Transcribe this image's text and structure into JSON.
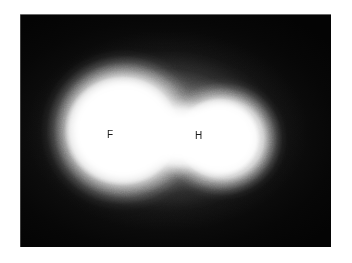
{
  "figure": {
    "kind": "grayscale-luminescence-image",
    "width": 352,
    "height": 263,
    "page_background": "#ffffff",
    "panel_background": "#050505",
    "emission_color": "#ffffff",
    "label_color": "#1a1a1a"
  },
  "panel": {
    "name": "dark-field-image",
    "left": 20,
    "top": 14,
    "width": 311,
    "height": 233
  },
  "regions": [
    {
      "id": "region-f",
      "label": "F",
      "role": "large-left-lobe",
      "center_x": 112,
      "center_y": 135,
      "radius_x": 86,
      "radius_y": 84,
      "peak_intensity": 255
    },
    {
      "id": "region-h",
      "label": "H",
      "role": "small-right-lobe",
      "center_x": 202,
      "center_y": 139,
      "radius_x": 68,
      "radius_y": 64,
      "peak_intensity": 255
    }
  ],
  "labels": {
    "f": "F",
    "h": "H"
  }
}
